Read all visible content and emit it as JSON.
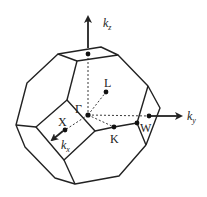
{
  "diagram": {
    "axes": {
      "kz": {
        "label": "k",
        "sub": "z"
      },
      "ky": {
        "label": "k",
        "sub": "y"
      },
      "kx": {
        "label": "k",
        "sub": "x"
      }
    },
    "points": {
      "gamma": "Γ",
      "L": "L",
      "X": "X",
      "K": "K",
      "W": "W"
    },
    "colors": {
      "line": "#222222",
      "background": "#ffffff"
    }
  }
}
